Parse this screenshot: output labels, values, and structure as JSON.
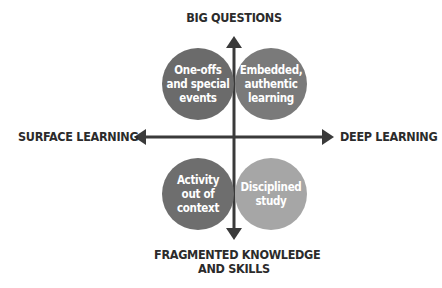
{
  "axes": {
    "top": "BIG QUESTIONS",
    "bottom_line1": "FRAGMENTED KNOWLEDGE",
    "bottom_line2": "AND SKILLS",
    "left": "SURFACE LEARNING",
    "right": "DEEP LEARNING"
  },
  "quadrants": [
    {
      "id": "top-left",
      "line1": "One-offs",
      "line2": "and special",
      "line3": "events",
      "color": "#6b6b6b"
    },
    {
      "id": "top-right",
      "line1": "Embedded,",
      "line2": "authentic",
      "line3": "learning",
      "color": "#7a7a7a"
    },
    {
      "id": "bottom-left",
      "line1": "Activity",
      "line2": "out of",
      "line3": "context",
      "color": "#6e6e6e"
    },
    {
      "id": "bottom-right",
      "line1": "Disciplined",
      "line2": "study",
      "line3": "",
      "color": "#a6a6a6"
    }
  ],
  "colors": {
    "axis": "#3a3a3a",
    "text": "#2b2b2b"
  }
}
